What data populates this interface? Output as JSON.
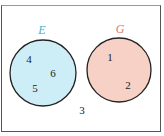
{
  "diagram": {
    "type": "venn",
    "universal_set_elements_outside": [
      "3"
    ],
    "sets": [
      {
        "name": "E",
        "label_color": "#4aaed6",
        "fill": "#cdeef6",
        "elements": [
          "4",
          "6",
          "5"
        ]
      },
      {
        "name": "G",
        "label_color": "#e0786a",
        "fill": "#f7d0c6",
        "elements": [
          "1",
          "2"
        ]
      }
    ],
    "outside": "3"
  }
}
